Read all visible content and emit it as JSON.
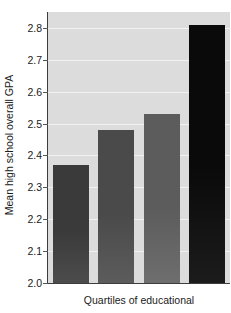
{
  "chart_data": {
    "type": "bar",
    "title": "",
    "xlabel": "Quartiles of educational",
    "ylabel": "Mean high school overall GPA",
    "categories": [
      "1",
      "2",
      "3",
      "4"
    ],
    "values": [
      2.37,
      2.48,
      2.53,
      2.81
    ],
    "ylim": [
      2.0,
      2.85
    ],
    "yticks": [
      2.0,
      2.1,
      2.2,
      2.3,
      2.4,
      2.5,
      2.6,
      2.7,
      2.8
    ],
    "ytick_labels": [
      "2.0",
      "2.1",
      "2.2",
      "2.3",
      "2.4",
      "2.5",
      "2.6",
      "2.7",
      "2.8"
    ],
    "grid": true,
    "legend": false,
    "bar_colors": [
      "#3a3a3a",
      "#4a4a4a",
      "#5c5c5c",
      "#0a0a0a"
    ],
    "plot_background": "#dcdcdc",
    "gridline_color": "#f2f2f2",
    "axis_color": "#3d3d3d"
  }
}
